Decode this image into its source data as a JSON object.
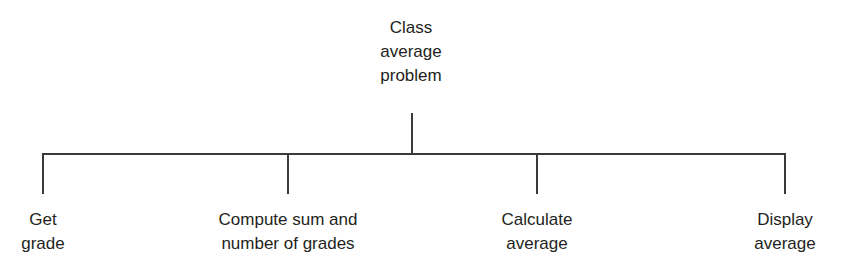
{
  "diagram": {
    "type": "hierarchy-chart",
    "root": {
      "line1": "Class",
      "line2": "average",
      "line3": "problem"
    },
    "children": [
      {
        "line1": "Get",
        "line2": "grade"
      },
      {
        "line1": "Compute sum and",
        "line2": "number of grades"
      },
      {
        "line1": "Calculate",
        "line2": "average"
      },
      {
        "line1": "Display",
        "line2": "average"
      }
    ],
    "line_color": "#3a3a3a",
    "text_color": "#231f20"
  }
}
